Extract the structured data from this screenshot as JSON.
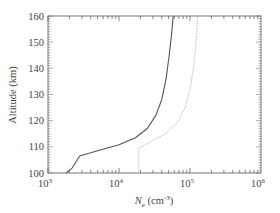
{
  "chart_data": {
    "type": "line",
    "title": "",
    "xlabel": "N_e (cm^-3)",
    "xlabel_main": "N",
    "xlabel_sub": "e",
    "xlabel_unit": "(cm",
    "xlabel_exp": "-3",
    "xlabel_close": ")",
    "ylabel": "Altitude (km)",
    "xscale": "log",
    "xlim": [
      1000,
      1000000
    ],
    "ylim": [
      100,
      160
    ],
    "grid": false,
    "legend": null,
    "x_ticks": [
      {
        "base": "10",
        "exp": "3",
        "value": 1000
      },
      {
        "base": "10",
        "exp": "4",
        "value": 10000
      },
      {
        "base": "10",
        "exp": "5",
        "value": 100000
      },
      {
        "base": "10",
        "exp": "6",
        "value": 1000000
      }
    ],
    "y_ticks": [
      "100",
      "110",
      "120",
      "130",
      "140",
      "150",
      "160"
    ],
    "series": [
      {
        "name": "profile-1",
        "style": "solid",
        "color": "#555555",
        "points": [
          {
            "x": 1800,
            "y": 100
          },
          {
            "x": 2200,
            "y": 102
          },
          {
            "x": 2800,
            "y": 106.5
          },
          {
            "x": 5000,
            "y": 108.5
          },
          {
            "x": 10000,
            "y": 110.8
          },
          {
            "x": 17000,
            "y": 113.5
          },
          {
            "x": 25000,
            "y": 117
          },
          {
            "x": 33000,
            "y": 122
          },
          {
            "x": 40000,
            "y": 128
          },
          {
            "x": 46000,
            "y": 136
          },
          {
            "x": 51000,
            "y": 145
          },
          {
            "x": 55000,
            "y": 153
          },
          {
            "x": 58000,
            "y": 160
          }
        ]
      },
      {
        "name": "profile-2",
        "style": "dotted",
        "color": "#bbbbbb",
        "points": [
          {
            "x": 19000,
            "y": 100
          },
          {
            "x": 19000,
            "y": 109.5
          },
          {
            "x": 28000,
            "y": 112
          },
          {
            "x": 45000,
            "y": 115
          },
          {
            "x": 65000,
            "y": 119
          },
          {
            "x": 85000,
            "y": 125
          },
          {
            "x": 100000,
            "y": 132
          },
          {
            "x": 112000,
            "y": 140
          },
          {
            "x": 120000,
            "y": 148
          },
          {
            "x": 125000,
            "y": 155
          },
          {
            "x": 128000,
            "y": 160
          }
        ]
      }
    ]
  }
}
